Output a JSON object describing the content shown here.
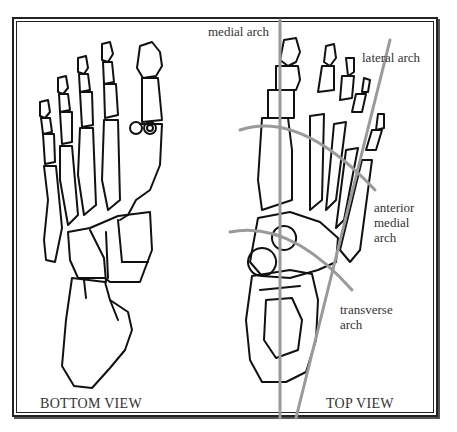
{
  "figure": {
    "frame_color": "#222222",
    "bone_stroke": "#111111",
    "arch_line_color": "#999999"
  },
  "labels": {
    "medial_arch": "medial arch",
    "lateral_arch": "lateral arch",
    "anterior_medial_arch": [
      "anterior",
      "medial",
      "arch"
    ],
    "transverse_arch": [
      "transverse",
      "arch"
    ]
  },
  "views": {
    "bottom": "BOTTOM VIEW",
    "top": "TOP VIEW"
  }
}
